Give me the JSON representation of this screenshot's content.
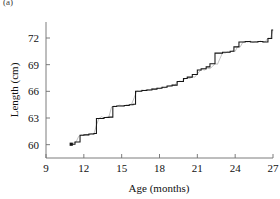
{
  "figure": {
    "panel_label": "(a)",
    "background": "#ffffff"
  },
  "chart_data": {
    "type": "line",
    "title": "",
    "subtitle": "",
    "xlabel": "Age (months)",
    "ylabel": "Length (cm)",
    "xlim": [
      9,
      27
    ],
    "ylim": [
      58.5,
      73.8
    ],
    "xticks": [
      9,
      12,
      15,
      18,
      21,
      24,
      27
    ],
    "xtick_labels": [
      "9",
      "12",
      "15",
      "18",
      "21",
      "24",
      "27"
    ],
    "yticks": [
      60,
      63,
      66,
      69,
      72
    ],
    "ytick_labels": [
      "60",
      "63",
      "66",
      "69",
      "72"
    ],
    "grid": false,
    "legend": false,
    "legend_position": "none",
    "axis_style": "left-and-bottom-spines",
    "colors": {
      "step_series": "#151515",
      "noise_series": "#8e8e8e",
      "axis": "#6e6e6e",
      "text": "#111111"
    },
    "series": [
      {
        "name": "Saltatory growth (fitted step function)",
        "style": "step",
        "color": "#151515",
        "x": [
          11.0,
          11.3,
          11.3,
          11.7,
          11.7,
          12.0,
          12.0,
          12.4,
          12.4,
          12.8,
          12.8,
          13.0,
          13.0,
          13.6,
          13.6,
          14.0,
          14.0,
          14.3,
          14.3,
          14.6,
          14.6,
          15.2,
          15.2,
          15.6,
          15.6,
          15.9,
          15.9,
          16.1,
          16.1,
          16.6,
          16.6,
          17.0,
          17.0,
          17.4,
          17.4,
          17.8,
          17.8,
          18.2,
          18.2,
          18.6,
          18.6,
          19.0,
          19.0,
          19.4,
          19.4,
          19.9,
          19.9,
          20.2,
          20.2,
          20.6,
          20.6,
          21.0,
          21.0,
          21.3,
          21.3,
          21.7,
          21.7,
          22.0,
          22.0,
          22.4,
          22.4,
          23.0,
          23.0,
          23.6,
          23.6,
          23.9,
          23.9,
          24.3,
          24.3,
          24.8,
          24.8,
          25.2,
          25.2,
          25.8,
          25.8,
          26.2,
          26.2,
          26.6,
          26.6,
          26.9,
          26.9,
          27.0
        ],
        "y": [
          60.05,
          60.05,
          60.3,
          60.3,
          61.05,
          61.05,
          61.1,
          61.1,
          61.2,
          61.2,
          61.25,
          61.25,
          62.95,
          62.95,
          63.05,
          63.05,
          63.1,
          63.1,
          64.3,
          64.3,
          64.35,
          64.35,
          64.4,
          64.4,
          64.5,
          64.5,
          64.55,
          64.55,
          66.0,
          66.0,
          66.1,
          66.1,
          66.15,
          66.15,
          66.25,
          66.25,
          66.35,
          66.35,
          66.45,
          66.45,
          66.6,
          66.6,
          66.7,
          66.7,
          67.1,
          67.1,
          67.45,
          67.45,
          67.6,
          67.6,
          67.9,
          67.9,
          68.4,
          68.4,
          68.55,
          68.55,
          68.75,
          68.75,
          69.1,
          69.1,
          70.3,
          70.3,
          70.4,
          70.4,
          70.5,
          70.5,
          71.0,
          71.0,
          71.55,
          71.55,
          71.6,
          71.6,
          71.55,
          71.55,
          71.6,
          71.6,
          71.55,
          71.55,
          71.95,
          71.95,
          72.9,
          72.9
        ]
      },
      {
        "name": "Raw measurements (daily observations)",
        "style": "jagged-overlay",
        "color": "#8e8e8e",
        "x": [
          11.0,
          11.2,
          11.4,
          11.6,
          11.8,
          12.0,
          12.2,
          12.4,
          12.6,
          12.8,
          13.0,
          13.2,
          13.4,
          13.6,
          13.8,
          14.0,
          14.2,
          14.4,
          14.6,
          14.8,
          15.0,
          15.2,
          15.4,
          15.6,
          15.8,
          16.0,
          16.2,
          16.4,
          16.6,
          16.8,
          17.0,
          17.2,
          17.4,
          17.6,
          17.8,
          18.0,
          18.2,
          18.4,
          18.6,
          18.8,
          19.0,
          19.2,
          19.4,
          19.6,
          19.8,
          20.0,
          20.2,
          20.4,
          20.6,
          20.8,
          21.0,
          21.2,
          21.4,
          21.6,
          21.8,
          22.0,
          22.2,
          22.4,
          22.6,
          22.8,
          23.0,
          23.2,
          23.4,
          23.6,
          23.8,
          24.0,
          24.2,
          24.4,
          24.6,
          24.8,
          25.0,
          25.2,
          25.4,
          25.6,
          25.8,
          26.0,
          26.2,
          26.4,
          26.6,
          26.8,
          27.0
        ],
        "y": [
          60.05,
          60.2,
          60.35,
          60.95,
          61.1,
          61.05,
          61.15,
          61.1,
          61.25,
          61.2,
          62.2,
          62.95,
          63.15,
          63.0,
          63.1,
          63.2,
          64.25,
          64.35,
          64.3,
          64.45,
          64.4,
          64.35,
          64.5,
          64.45,
          64.6,
          65.3,
          66.05,
          66.0,
          66.15,
          66.1,
          66.2,
          66.15,
          66.3,
          66.25,
          66.35,
          66.3,
          66.45,
          66.4,
          66.55,
          66.6,
          66.7,
          66.65,
          67.05,
          67.15,
          67.1,
          67.4,
          67.5,
          67.45,
          67.65,
          67.6,
          67.95,
          68.3,
          68.45,
          68.4,
          68.6,
          68.55,
          68.8,
          69.1,
          69.05,
          69.7,
          70.35,
          70.3,
          70.45,
          70.4,
          70.55,
          70.5,
          71.05,
          71.0,
          71.5,
          71.6,
          71.55,
          71.65,
          71.5,
          71.6,
          71.55,
          71.65,
          71.55,
          71.6,
          72.0,
          71.95,
          72.9
        ]
      }
    ],
    "annotations": []
  }
}
